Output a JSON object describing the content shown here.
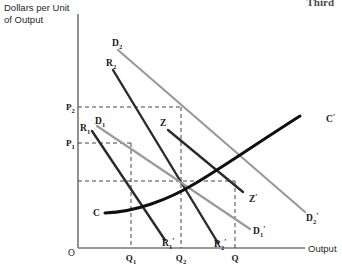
{
  "figure": {
    "page_header_fragment": "Third",
    "y_axis_label": "Dollars per Unit\nof Output",
    "x_axis_label": "Output",
    "origin_label": "O"
  },
  "chart_data": {
    "type": "line",
    "title": "",
    "xlabel": "Output",
    "ylabel": "Dollars per Unit of Output",
    "grid": false,
    "legend": "inline-curve-labels",
    "axis_ranges": {
      "x_pixels": [
        78,
        305
      ],
      "y_pixels": [
        248,
        14
      ]
    },
    "x_ticks": [
      {
        "label": "Q",
        "sub": "1",
        "x": 131
      },
      {
        "label": "Q",
        "sub": "2",
        "x": 181
      },
      {
        "label": "Q",
        "sub": "",
        "x": 235
      }
    ],
    "y_ticks": [
      {
        "label": "P",
        "sub": "2",
        "y": 107
      },
      {
        "label": "P",
        "sub": "1",
        "y": 143
      }
    ],
    "series": [
      {
        "name": "D2",
        "label": "D",
        "sub": "2",
        "end_label": "D",
        "end_sub": "2'",
        "role": "demand-curve-high",
        "color": "#9a9a9a",
        "style": "solid",
        "width": 2.2,
        "points": [
          [
            118,
            50
          ],
          [
            305,
            212
          ]
        ]
      },
      {
        "name": "R2",
        "label": "R",
        "sub": "2",
        "end_label": "R",
        "end_sub": "2'",
        "role": "marginal-revenue-high",
        "color": "#2b2b2b",
        "style": "solid",
        "width": 2.4,
        "points": [
          [
            113,
            70
          ],
          [
            218,
            243
          ]
        ]
      },
      {
        "name": "D1",
        "label": "D",
        "sub": "1",
        "end_label": "D",
        "end_sub": "1'",
        "role": "demand-curve-low",
        "color": "#9a9a9a",
        "style": "solid",
        "width": 2.2,
        "points": [
          [
            97,
            126
          ],
          [
            250,
            229
          ]
        ]
      },
      {
        "name": "R1",
        "label": "R",
        "sub": "1",
        "end_label": "R",
        "end_sub": "1'",
        "role": "marginal-revenue-low",
        "color": "#2b2b2b",
        "style": "solid",
        "width": 2.4,
        "points": [
          [
            92,
            131
          ],
          [
            165,
            240
          ]
        ]
      },
      {
        "name": "Z",
        "label": "Z",
        "sub": "",
        "end_label": "Z",
        "end_sub": "'",
        "role": "expansion-path",
        "color": "#2b2b2b",
        "style": "solid",
        "width": 2.4,
        "points": [
          [
            168,
            130
          ],
          [
            243,
            192
          ]
        ]
      },
      {
        "name": "C",
        "label": "C",
        "sub": "",
        "end_label": "C",
        "end_sub": "'",
        "role": "cost-curve",
        "color": "#101010",
        "style": "curve",
        "width": 3.0,
        "path": "M 105 213 C 135 212, 168 200, 196 183 C 226 165, 262 140, 300 116"
      }
    ],
    "annotations": [
      {
        "name": "label-D2",
        "text": "D",
        "sub": "2",
        "x": 112,
        "y": 46
      },
      {
        "name": "label-R2",
        "text": "R",
        "sub": "2",
        "x": 106,
        "y": 66
      },
      {
        "name": "label-D1",
        "text": "D",
        "sub": "1",
        "x": 95,
        "y": 124
      },
      {
        "name": "label-R1",
        "text": "R",
        "sub": "1",
        "x": 80,
        "y": 131
      },
      {
        "name": "label-Z",
        "text": "Z",
        "sub": "",
        "x": 160,
        "y": 126
      },
      {
        "name": "label-Cprime",
        "text": "C",
        "sub": "'",
        "x": 326,
        "y": 122
      },
      {
        "name": "label-C",
        "text": "C",
        "sub": "",
        "x": 93,
        "y": 216
      },
      {
        "name": "label-Zprime",
        "text": "Z",
        "sub": "'",
        "x": 249,
        "y": 202
      },
      {
        "name": "label-D1prime",
        "text": "D",
        "sub": "1'",
        "x": 253,
        "y": 234
      },
      {
        "name": "label-D2prime",
        "text": "D",
        "sub": "2'",
        "x": 306,
        "y": 221
      },
      {
        "name": "label-R1prime",
        "text": "R",
        "sub": "1'",
        "x": 162,
        "y": 246
      },
      {
        "name": "label-R2prime",
        "text": "R",
        "sub": "2'",
        "x": 214,
        "y": 247
      }
    ],
    "guide_lines": [
      {
        "name": "guide-P2-horizontal",
        "orientation": "horizontal",
        "from": [
          78,
          107
        ],
        "to": [
          181,
          107
        ]
      },
      {
        "name": "guide-Q2-vertical",
        "orientation": "vertical",
        "from": [
          181,
          107
        ],
        "to": [
          181,
          248
        ]
      },
      {
        "name": "guide-P1-horizontal",
        "orientation": "horizontal",
        "from": [
          78,
          143
        ],
        "to": [
          131,
          143
        ]
      },
      {
        "name": "guide-Q1-vertical",
        "orientation": "vertical",
        "from": [
          131,
          143
        ],
        "to": [
          131,
          248
        ]
      },
      {
        "name": "guide-equilibrium-horizontal",
        "orientation": "horizontal",
        "from": [
          78,
          181
        ],
        "to": [
          235,
          181
        ]
      },
      {
        "name": "guide-Q-vertical",
        "orientation": "vertical",
        "from": [
          235,
          181
        ],
        "to": [
          235,
          248
        ]
      }
    ]
  }
}
